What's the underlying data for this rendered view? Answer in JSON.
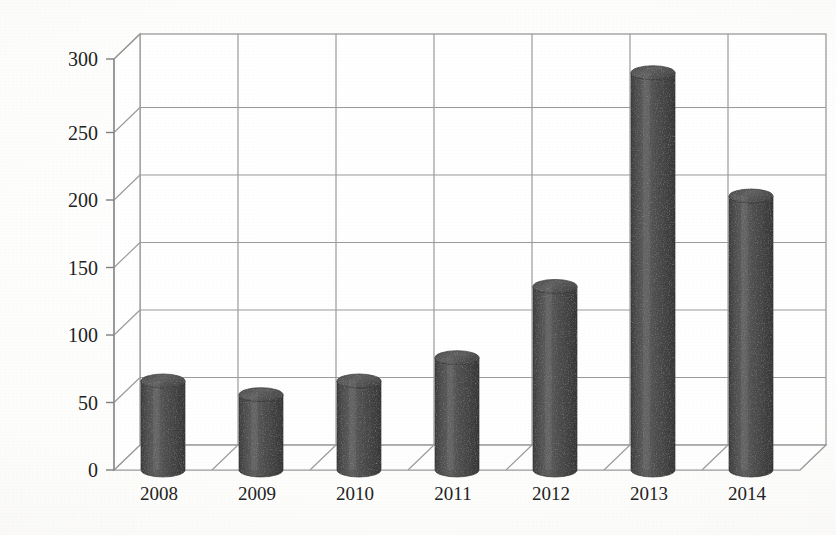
{
  "chart_data": {
    "type": "bar",
    "title": "",
    "subtitle": "",
    "xlabel": "",
    "ylabel": "",
    "categories": [
      "2008",
      "2009",
      "2010",
      "2011",
      "2012",
      "2013",
      "2014"
    ],
    "values": [
      65,
      55,
      65,
      82,
      134,
      290,
      200
    ],
    "series": [
      {
        "name": "",
        "values": [
          65,
          55,
          65,
          82,
          134,
          290,
          200
        ]
      }
    ],
    "ylim": [
      0,
      300
    ],
    "yticks": [
      0,
      50,
      100,
      150,
      200,
      250,
      300
    ],
    "ytick_labels": [
      "0",
      "50",
      "100",
      "150",
      "200",
      "250",
      "300"
    ],
    "grid": true,
    "grid_axis": "y",
    "legend": false,
    "legend_position": "none",
    "style": "3d-cylinder",
    "bar_shape": "cylinder",
    "bar_color": "#4a4a4a",
    "bar_color_light": "#6b6b6b",
    "bar_color_dark": "#3a3a3a",
    "bar_top_color": "#5c5c5c",
    "grid_color": "#9a9a9a",
    "axis_color": "#8c8c8c",
    "plot_background": "#ffffff",
    "annotations": []
  },
  "figure": {
    "width": 836,
    "height": 535,
    "background": "#ffffff",
    "rendering": "scanned-page"
  },
  "geometry": {
    "front_baseline_y": 470,
    "back_baseline_y": 445,
    "back_top_y": 34,
    "plot_left_x": 114,
    "plot_right_x": 800,
    "depth_dx": 26,
    "depth_dy": 25,
    "px_per_unit": 1.37,
    "cylinder_width": 44,
    "cylinder_ellipse_ry": 7
  },
  "bleed_text": [
    {
      "text": "",
      "x": 60,
      "y": 510
    },
    {
      "text": "",
      "x": 420,
      "y": 318
    }
  ]
}
